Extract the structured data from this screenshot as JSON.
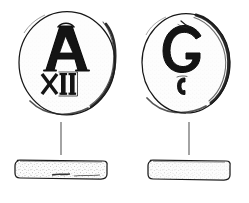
{
  "figure": {
    "title": "Archaeological line drawing of two stamped discs",
    "background_color": "#ffffff",
    "ink_color": "#1a1a1a",
    "tie_line_color": "#8d8d8d",
    "width": 249,
    "height": 203
  },
  "objects": [
    {
      "id": "left",
      "label": "left-disc",
      "plan": {
        "center_x": 67,
        "center_y": 63,
        "radius_x": 48,
        "radius_y": 52,
        "stamp_primary": "A",
        "stamp_secondary": "XII",
        "stamp_secondary_meaning": "Roman numeral twelve"
      },
      "profile": {
        "x": 14,
        "y": 160,
        "width": 94,
        "height": 19,
        "description": "flat thin disc seen edge-on"
      },
      "tie_line": {
        "x": 61,
        "y_top": 122,
        "y_bottom": 155
      }
    },
    {
      "id": "right",
      "label": "right-disc",
      "plan": {
        "center_x": 186,
        "center_y": 63,
        "radius_x": 44,
        "radius_y": 50,
        "stamp_primary": "G",
        "stamp_secondary": "C",
        "stamp_secondary_meaning": "small secondary punch mark"
      },
      "profile": {
        "x": 147,
        "y": 160,
        "width": 84,
        "height": 20,
        "description": "flat thin disc seen edge-on, slightly thicker"
      },
      "tie_line": {
        "x": 189,
        "y_top": 122,
        "y_bottom": 155
      }
    }
  ]
}
